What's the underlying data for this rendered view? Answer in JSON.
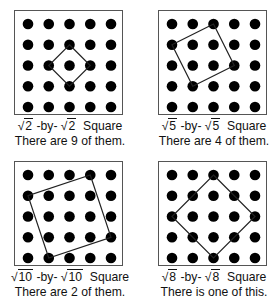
{
  "grid": {
    "rows": 5,
    "cols": 5
  },
  "panels": [
    {
      "radicand": "2",
      "label_sep": "-by-",
      "shape": "Square",
      "count_text": "There are 9 of them.",
      "vertices": [
        [
          2,
          1
        ],
        [
          3,
          2
        ],
        [
          2,
          3
        ],
        [
          1,
          2
        ]
      ]
    },
    {
      "radicand": "5",
      "label_sep": "-by-",
      "shape": "Square",
      "count_text": "There are 4 of them.",
      "vertices": [
        [
          2,
          0
        ],
        [
          3,
          2
        ],
        [
          1,
          3
        ],
        [
          0,
          1
        ]
      ]
    },
    {
      "radicand": "10",
      "label_sep": "-by-",
      "shape": "Square",
      "count_text": "There are 2 of them.",
      "vertices": [
        [
          3,
          0
        ],
        [
          4,
          3
        ],
        [
          1,
          4
        ],
        [
          0,
          1
        ]
      ]
    },
    {
      "radicand": "8",
      "label_sep": "-by-",
      "shape": "Square",
      "count_text": "There is one of this.",
      "vertices": [
        [
          2,
          0
        ],
        [
          4,
          2
        ],
        [
          2,
          4
        ],
        [
          0,
          2
        ]
      ]
    }
  ],
  "sqrt_symbol": "√",
  "colors": {
    "dot": "#000000",
    "frame": "#555555",
    "line": "#222222"
  }
}
